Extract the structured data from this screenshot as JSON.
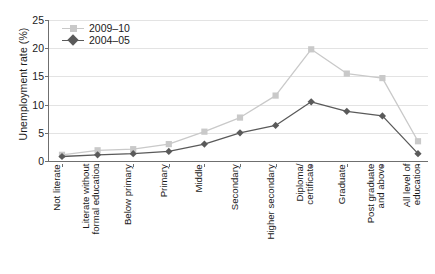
{
  "chart_data": {
    "type": "line",
    "title": "",
    "xlabel": "",
    "ylabel": "Unemployment rate (%)",
    "ylim": [
      0,
      25
    ],
    "yticks": [
      0,
      5,
      10,
      15,
      20,
      25
    ],
    "grid": true,
    "legend_position": "top-left",
    "categories": [
      "Not literate",
      "Literate without formal education",
      "Below primary",
      "Primary",
      "Middle",
      "Secondary",
      "Higher secondary",
      "Diploma/ certificate",
      "Graduate",
      "Post graduate and above",
      "All level of education"
    ],
    "category_lines": [
      [
        "Not literate"
      ],
      [
        "Literate without",
        "formal education"
      ],
      [
        "Below primary"
      ],
      [
        "Primary"
      ],
      [
        "Middle"
      ],
      [
        "Secondary"
      ],
      [
        "Higher secondary"
      ],
      [
        "Diploma/",
        "certificate"
      ],
      [
        "Graduate"
      ],
      [
        "Post graduate",
        "and above"
      ],
      [
        "All level of",
        "education"
      ]
    ],
    "series": [
      {
        "name": "2009–10",
        "color": "#c9c9c9",
        "marker": "square",
        "values": [
          1.1,
          1.9,
          2.1,
          3.0,
          5.2,
          7.7,
          11.6,
          19.8,
          15.5,
          14.7,
          3.5
        ]
      },
      {
        "name": "2004–05",
        "color": "#5a5a5a",
        "marker": "diamond",
        "values": [
          0.8,
          1.1,
          1.3,
          1.7,
          3.0,
          5.0,
          6.3,
          10.5,
          8.8,
          8.0,
          1.3
        ]
      }
    ]
  },
  "legend": {
    "items": [
      {
        "label": "2009–10"
      },
      {
        "label": "2004–05"
      }
    ]
  },
  "colors": {
    "series_2009_10": "#c9c9c9",
    "series_2004_05": "#5a5a5a",
    "axis": "#6f6f6f",
    "grid": "#e3e3e3",
    "text": "#1a1a1a",
    "background": "#ffffff"
  }
}
